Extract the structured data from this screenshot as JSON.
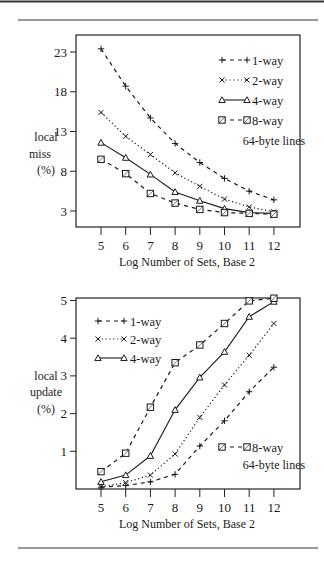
{
  "figure": {
    "x_label": "Log Number of Sets, Base 2",
    "note": "64-byte lines"
  },
  "chart_data": [
    {
      "type": "line",
      "title": "",
      "xlabel": "Log Number of Sets, Base 2",
      "ylabel": [
        "local",
        "miss",
        "(%)"
      ],
      "x": [
        5,
        6,
        7,
        8,
        9,
        10,
        11,
        12
      ],
      "x_ticks": [
        5,
        6,
        7,
        8,
        9,
        10,
        11,
        12
      ],
      "y_ticks": [
        3,
        8,
        13,
        18,
        23
      ],
      "ylim": [
        0.5,
        25.2
      ],
      "grid": false,
      "legend_position": "upper right",
      "annotation": "64-byte lines",
      "series": [
        {
          "name": "1-way",
          "marker": "plus",
          "line": "dashed",
          "values": [
            23.4,
            18.7,
            14.7,
            11.5,
            9.1,
            7.1,
            5.5,
            4.4
          ]
        },
        {
          "name": "2-way",
          "marker": "x",
          "line": "dotted",
          "values": [
            15.4,
            12.4,
            10.1,
            7.8,
            6.1,
            4.5,
            3.5,
            2.9
          ]
        },
        {
          "name": "4-way",
          "marker": "triangle",
          "line": "solid",
          "values": [
            11.6,
            9.7,
            7.6,
            5.4,
            4.3,
            3.3,
            2.8,
            2.7
          ]
        },
        {
          "name": "8-way",
          "marker": "square",
          "line": "dashed",
          "values": [
            9.5,
            7.7,
            5.2,
            4.0,
            3.2,
            2.8,
            2.7,
            2.6
          ]
        }
      ]
    },
    {
      "type": "line",
      "title": "",
      "xlabel": "Log Number of Sets, Base 2",
      "ylabel": [
        "local",
        "update",
        "(%)"
      ],
      "x": [
        5,
        6,
        7,
        8,
        9,
        10,
        11,
        12
      ],
      "x_ticks": [
        5,
        6,
        7,
        8,
        9,
        10,
        11,
        12
      ],
      "y_ticks": [
        1,
        2,
        3,
        4,
        5
      ],
      "ylim": [
        0,
        5.05
      ],
      "grid": false,
      "legend_position": "upper left (1/2/4-way), lower right (8-way)",
      "annotation": "64-byte lines",
      "series": [
        {
          "name": "1-way",
          "marker": "plus",
          "line": "dashed",
          "values": [
            0.05,
            0.09,
            0.19,
            0.39,
            1.14,
            1.81,
            2.58,
            3.23
          ]
        },
        {
          "name": "2-way",
          "marker": "x",
          "line": "dotted",
          "values": [
            0.06,
            0.17,
            0.37,
            0.93,
            1.9,
            2.76,
            3.55,
            4.39
          ]
        },
        {
          "name": "4-way",
          "marker": "triangle",
          "line": "solid",
          "values": [
            0.19,
            0.37,
            0.88,
            2.1,
            2.96,
            3.64,
            4.57,
            4.97
          ]
        },
        {
          "name": "8-way",
          "marker": "square",
          "line": "dashed",
          "values": [
            0.46,
            0.95,
            2.17,
            3.35,
            3.82,
            4.39,
            4.99,
            5.06
          ]
        }
      ]
    }
  ]
}
